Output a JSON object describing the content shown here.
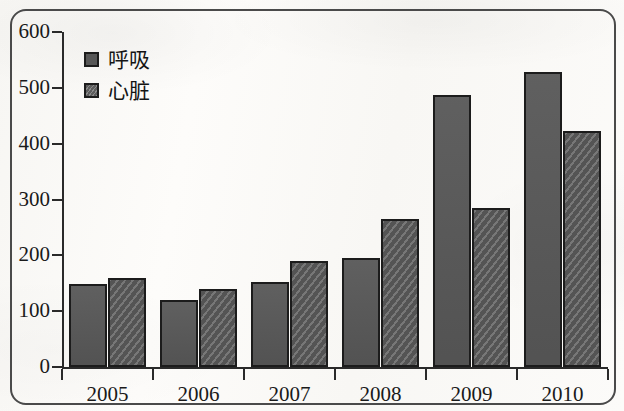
{
  "chart_data": {
    "type": "bar",
    "title": "",
    "subtitle": "",
    "xlabel": "",
    "ylabel": "",
    "categories": [
      "2005",
      "2006",
      "2007",
      "2008",
      "2009",
      "2010"
    ],
    "series": [
      {
        "name": "呼吸",
        "values": [
          148,
          120,
          153,
          196,
          488,
          529
        ],
        "color": "#575757",
        "fill": "solid"
      },
      {
        "name": "心脏",
        "values": [
          160,
          140,
          189,
          265,
          285,
          422
        ],
        "color": "#5d5d5d",
        "fill": "diagonal-hatch"
      }
    ],
    "ylim": [
      0,
      600
    ],
    "y_ticks": [
      "0",
      "100",
      "200",
      "300",
      "400",
      "500",
      "600"
    ],
    "grid": false,
    "legend_position": "top-left"
  },
  "legend": {
    "items": [
      {
        "label": "呼吸"
      },
      {
        "label": "心脏"
      }
    ]
  },
  "axes": {
    "y_tick_labels": [
      "600",
      "500",
      "400",
      "300",
      "200",
      "100",
      "0"
    ],
    "x_tick_labels": [
      "2005",
      "2006",
      "2007",
      "2008",
      "2009",
      "2010"
    ]
  }
}
